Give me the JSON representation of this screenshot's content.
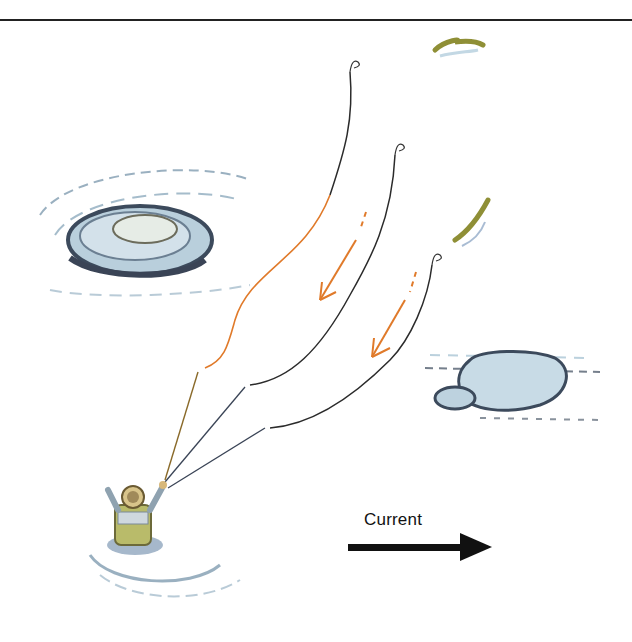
{
  "illustration": {
    "subject": "fly fishing angler casting across river with mends",
    "current_label": "Current",
    "arrow_direction": "right",
    "colors": {
      "line": "#2b2b2b",
      "mend_orange": "#e07a2a",
      "water_blue": "#8fb3c8",
      "rock_dark": "#4a5566",
      "fish_olive": "#9a9a3c"
    },
    "elements": [
      "top-rule",
      "fish-top",
      "fish-middle",
      "rock-left",
      "rock-right",
      "angler",
      "line-1",
      "line-2",
      "line-3",
      "mend-arrow-1",
      "mend-arrow-2",
      "current-arrow"
    ]
  }
}
